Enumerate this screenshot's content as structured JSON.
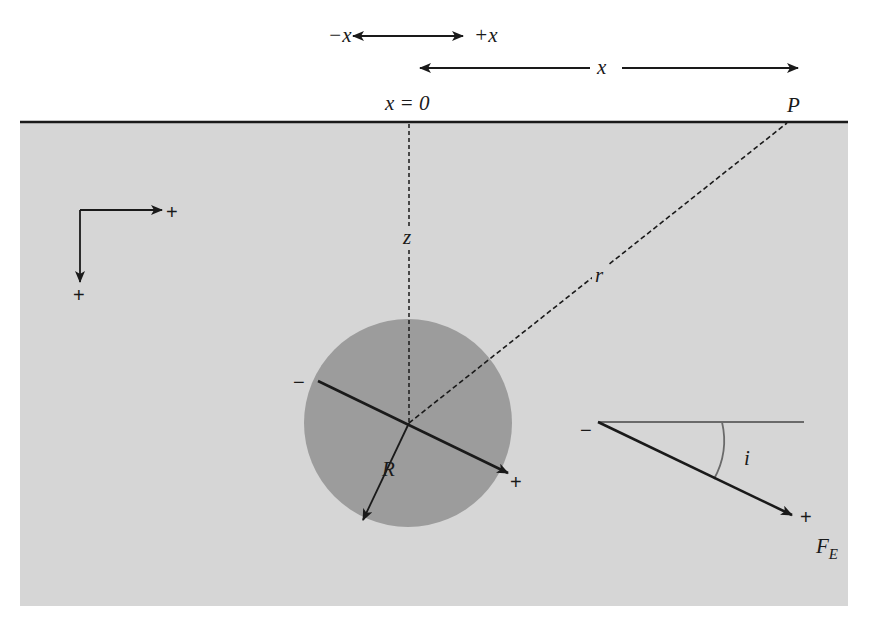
{
  "figure": {
    "labels": {
      "neg_x": "−x",
      "pos_x": "+x",
      "x_distance": "x",
      "x_origin": "x = 0",
      "point": "P",
      "depth": "z",
      "distance": "r",
      "radius": "R",
      "angle": "i",
      "field_main": "F",
      "field_sub": "E"
    },
    "signs": {
      "axis_x_plus": "+",
      "axis_z_plus": "+",
      "dipole_minus": "−",
      "dipole_plus": "+",
      "inset_minus": "−",
      "inset_plus": "+"
    },
    "colors": {
      "ground": "#d6d6d6",
      "sphere": "#9c9c9c",
      "ink": "#1a1a1a",
      "angle_line": "#6a6a6a"
    }
  }
}
